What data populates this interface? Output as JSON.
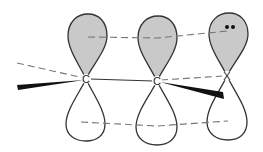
{
  "diagram": {
    "title": "",
    "type": "p-orbital overlap diagram",
    "atoms": [
      {
        "label": "C",
        "x": 86,
        "y": 79
      },
      {
        "label": "C",
        "x": 157,
        "y": 81
      },
      {
        "label": "X",
        "x": 227,
        "y": 76
      }
    ],
    "lone_pair_on": "X",
    "colors": {
      "upper_lobe_fill": "#c9c9c9",
      "lower_lobe_fill": "#ffffff",
      "outline": "#333333",
      "dash": "#777777",
      "wedge": "#111111"
    }
  }
}
